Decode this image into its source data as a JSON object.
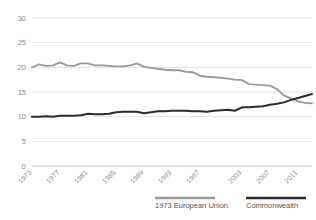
{
  "chart_data": {
    "type": "line",
    "title": "",
    "subtitle": "",
    "xlabel": "",
    "ylabel": "",
    "ylim": [
      0,
      30
    ],
    "yticks": [
      0,
      5,
      10,
      15,
      20,
      25,
      30
    ],
    "ytick_labels": [
      "0",
      "5",
      "10",
      "15",
      "20",
      "25",
      "30"
    ],
    "xlim": [
      1973,
      2013
    ],
    "xticks": [
      1973,
      1977,
      1981,
      1985,
      1989,
      1993,
      1997,
      2003,
      2007,
      2011
    ],
    "xtick_labels": [
      "1973",
      "1977",
      "1981",
      "1985",
      "1989",
      "1993",
      "1997",
      "2003",
      "2007",
      "2011"
    ],
    "grid": "horizontal",
    "legend_position": "bottom",
    "x": [
      1973,
      1974,
      1975,
      1976,
      1977,
      1978,
      1979,
      1980,
      1981,
      1982,
      1983,
      1984,
      1985,
      1986,
      1987,
      1988,
      1989,
      1990,
      1991,
      1992,
      1993,
      1994,
      1995,
      1996,
      1997,
      1998,
      1999,
      2000,
      2001,
      2002,
      2003,
      2004,
      2005,
      2006,
      2007,
      2008,
      2009,
      2010,
      2011,
      2012,
      2013
    ],
    "series": [
      {
        "name": "1973 European Union",
        "color": "#9a9a9a",
        "values": [
          20.0,
          20.6,
          20.3,
          20.4,
          21.0,
          20.4,
          20.3,
          20.8,
          20.8,
          20.4,
          20.4,
          20.3,
          20.2,
          20.2,
          20.4,
          20.8,
          20.1,
          19.9,
          19.7,
          19.5,
          19.4,
          19.4,
          19.1,
          19.0,
          18.3,
          18.1,
          18.0,
          17.9,
          17.7,
          17.5,
          17.4,
          16.6,
          16.5,
          16.4,
          16.3,
          15.6,
          14.3,
          13.7,
          13.1,
          12.8,
          12.7
        ]
      },
      {
        "name": "Commonwealth",
        "color": "#2b2b2b",
        "values": [
          10.0,
          10.0,
          10.1,
          10.0,
          10.2,
          10.2,
          10.2,
          10.3,
          10.6,
          10.5,
          10.5,
          10.6,
          10.9,
          11.0,
          11.0,
          11.0,
          10.7,
          10.9,
          11.1,
          11.1,
          11.2,
          11.2,
          11.2,
          11.1,
          11.1,
          11.0,
          11.2,
          11.3,
          11.4,
          11.2,
          11.9,
          11.9,
          12.0,
          12.1,
          12.4,
          12.6,
          12.9,
          13.4,
          13.8,
          14.2,
          14.6
        ]
      }
    ],
    "legend": [
      {
        "label": "1973 European Union",
        "color": "#9a9a9a"
      },
      {
        "label": "Commonwealth",
        "color": "#2b2b2b"
      }
    ]
  }
}
